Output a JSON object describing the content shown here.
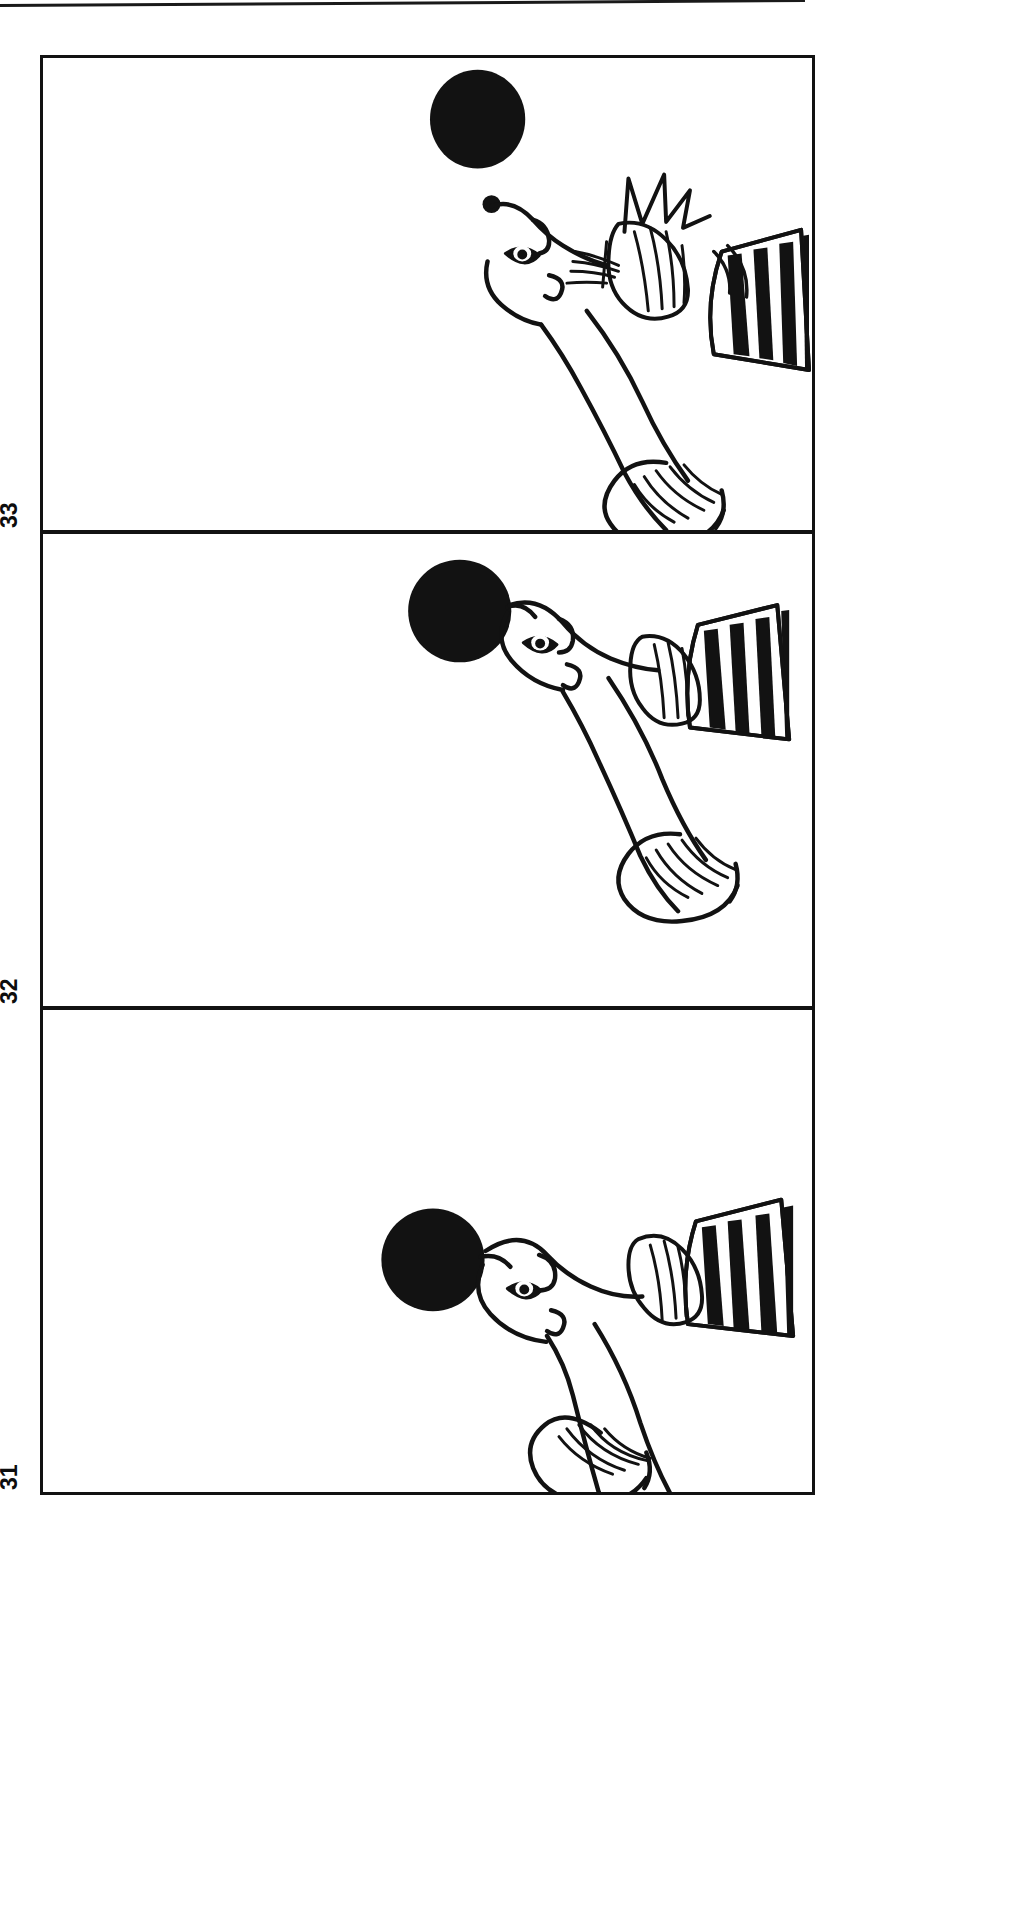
{
  "document": {
    "type": "scanned comic strip page",
    "orientation": "rotated-90",
    "background_color": "#ffffff",
    "ink_color": "#121212"
  },
  "strip": {
    "panel_count": 3,
    "panels": [
      {
        "number": "33",
        "order": 1,
        "caption": "",
        "scene": "Seal with head tilted back, ball launched into the air above its nose; impact starburst near the striped fan",
        "ball": {
          "shape": "circle",
          "fill": "#111111",
          "state": "in the air, detached from nose"
        },
        "starburst": {
          "visible": true,
          "points": 4
        },
        "fan": {
          "stripes": 4,
          "fill": "#111111"
        }
      },
      {
        "number": "32",
        "order": 2,
        "caption": "",
        "scene": "Seal balancing the black ball on the tip of its nose, body arched, striped fan behind",
        "ball": {
          "shape": "circle",
          "fill": "#111111",
          "state": "balanced on nose"
        },
        "starburst": {
          "visible": false,
          "points": 0
        },
        "fan": {
          "stripes": 4,
          "fill": "#111111"
        }
      },
      {
        "number": "31",
        "order": 3,
        "caption": "",
        "scene": "Seal balancing the black ball on its nose, head lower, tail flipper curled up at left, striped fan behind",
        "ball": {
          "shape": "circle",
          "fill": "#111111",
          "state": "balanced on nose"
        },
        "starburst": {
          "visible": false,
          "points": 0
        },
        "fan": {
          "stripes": 4,
          "fill": "#111111"
        }
      }
    ]
  }
}
